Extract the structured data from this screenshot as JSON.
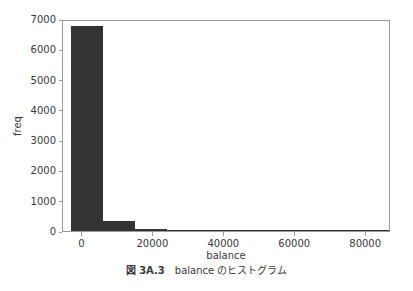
{
  "figure": {
    "caption_number": "図 3A.3",
    "caption_text": "balance のヒストグラム"
  },
  "chart_data": {
    "type": "bar",
    "title": "",
    "subtitle": "",
    "xlabel": "balance",
    "ylabel": "freq",
    "xlim": [
      -5500,
      87000
    ],
    "ylim": [
      0,
      7000
    ],
    "grid": false,
    "legend": null,
    "bar_color": "#333333",
    "axis_color": "#9a9a9a",
    "text_color": "#3a3a3a",
    "xticks": [
      0,
      20000,
      40000,
      60000,
      80000
    ],
    "xticklabels": [
      "0",
      "20000",
      "40000",
      "60000",
      "80000"
    ],
    "yticks": [
      0,
      1000,
      2000,
      3000,
      4000,
      5000,
      6000,
      7000
    ],
    "yticklabels": [
      "0",
      "1000",
      "2000",
      "3000",
      "4000",
      "5000",
      "6000",
      "7000"
    ],
    "bin_edges": [
      -3300,
      5700,
      14700,
      23700,
      32700,
      41700,
      50700,
      59700,
      68700,
      77700,
      86700
    ],
    "bins": [
      {
        "x0": -3300,
        "x1": 5700,
        "value": 6780
      },
      {
        "x0": 5700,
        "x1": 14700,
        "value": 345
      },
      {
        "x0": 14700,
        "x1": 23700,
        "value": 72
      },
      {
        "x0": 23700,
        "x1": 32700,
        "value": 22
      },
      {
        "x0": 32700,
        "x1": 41700,
        "value": 6
      },
      {
        "x0": 41700,
        "x1": 50700,
        "value": 3
      },
      {
        "x0": 50700,
        "x1": 59700,
        "value": 2
      },
      {
        "x0": 59700,
        "x1": 68700,
        "value": 1
      },
      {
        "x0": 68700,
        "x1": 77700,
        "value": 1
      },
      {
        "x0": 77700,
        "x1": 86700,
        "value": 1
      }
    ]
  }
}
